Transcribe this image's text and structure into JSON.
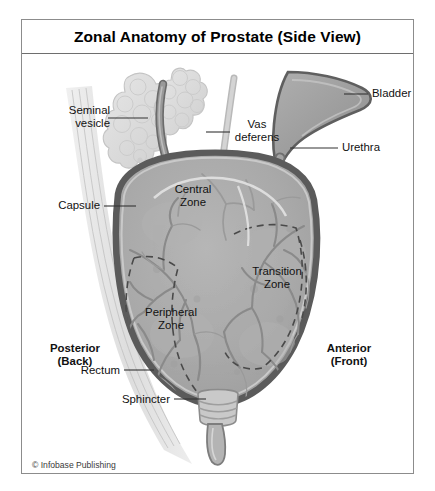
{
  "figure": {
    "title": "Zonal Anatomy of Prostate (Side View)",
    "copyright": "© Infobase Publishing",
    "frame_color": "#8c8c8c",
    "background": "#ffffff"
  },
  "labels": {
    "seminal_vesicle": "Seminal\nvesicle",
    "vas_deferens": "Vas\ndeferens",
    "bladder": "Bladder",
    "urethra": "Urethra",
    "capsule": "Capsule",
    "central_zone": "Central\nZone",
    "transition_zone": "Transition\nZone",
    "peripheral_zone": "Peripheral\nZone",
    "posterior": "Posterior\n(Back)",
    "anterior": "Anterior\n(Front)",
    "rectum": "Rectum",
    "sphincter": "Sphincter"
  },
  "colors": {
    "gland_fill": "#a9a9a9",
    "gland_fill_light": "#b4b4b4",
    "capsule_dark": "#5b5b5b",
    "capsule_inner": "#c9c9c9",
    "vessel": "#8a8a8a",
    "vessel_dark": "#6f6f6f",
    "vesicle_fill": "#dcdcdc",
    "vesicle_edge": "#c2c2c2",
    "vas_fill": "#909090",
    "vas_edge": "#6b6b6b",
    "bladder_fill": "#9a9a9a",
    "bladder_edge": "#5f5f5f",
    "urethra_fill": "#bdbdbd",
    "urethra_edge": "#7d7d7d",
    "rectum_fill": "#dadada",
    "sphincter_fill": "#c4c4c4",
    "leader": "#333333",
    "dashed_boundary": "#4a4a4a",
    "text": "#111111"
  }
}
